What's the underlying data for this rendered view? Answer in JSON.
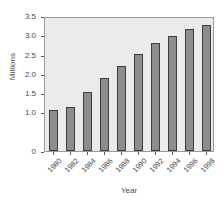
{
  "chart_data": {
    "type": "bar",
    "title": "",
    "xlabel": "Year",
    "ylabel": "Millions",
    "categories": [
      "1980",
      "1982",
      "1984",
      "1986",
      "1988",
      "1990",
      "1992",
      "1994",
      "1996",
      "1998"
    ],
    "values": [
      1.06,
      1.13,
      1.52,
      1.89,
      2.2,
      2.52,
      2.81,
      2.97,
      3.17,
      3.27
    ],
    "series": [
      {
        "name": "Millions",
        "values": [
          1.06,
          1.13,
          1.52,
          1.89,
          2.2,
          2.52,
          2.81,
          2.97,
          3.17,
          3.27
        ]
      }
    ],
    "ylim": [
      0,
      3.5
    ],
    "ytick_values": [
      3.5,
      3.0,
      2.5,
      2.0,
      1.5,
      1.0,
      0.0
    ],
    "ytick_labels": [
      "3.5",
      "3.0",
      "2.5",
      "2.0",
      "1.5",
      "1.0",
      "0"
    ],
    "grid": false,
    "legend": null,
    "legend_position": "none",
    "bar_color": "#8d8d8d",
    "bar_edge_color": "#3d3d3d",
    "plot_background": "#ebebeb",
    "figure_background": "#ffffff",
    "axis_color": "#9a9a9a",
    "text_color": "#4a4a4a",
    "xtick_label_rotation": -45
  }
}
